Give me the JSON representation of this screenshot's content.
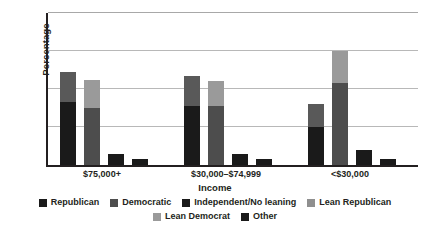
{
  "chart_data": {
    "type": "bar",
    "subtype": "grouped-stacked-bar",
    "title": "",
    "xlabel": "Income",
    "ylabel": "Percentage",
    "ylim": [
      0,
      80
    ],
    "yticks": [
      0,
      20,
      40,
      60,
      80
    ],
    "grid": true,
    "legend_position": "bottom",
    "categories": [
      "$75,000+",
      "$30,000–$74,999",
      "<$30,000"
    ],
    "series": [
      {
        "name": "Republican",
        "color": "#1a1a1a",
        "values": [
          33,
          31,
          20
        ]
      },
      {
        "name": "Lean Republican",
        "color": "#595959",
        "values": [
          16,
          16,
          12
        ]
      },
      {
        "name": "Democratic",
        "color": "#4d4d4d",
        "values": [
          30,
          31,
          43
        ]
      },
      {
        "name": "Lean Democrat",
        "color": "#9a9a9a",
        "values": [
          15,
          13,
          17
        ]
      },
      {
        "name": "Independent/No leaning",
        "color": "#1a1a1a",
        "values": [
          6,
          6,
          8
        ]
      },
      {
        "name": "Other",
        "color": "#1a1a1a",
        "values": [
          3,
          3,
          3
        ]
      }
    ],
    "bars": [
      {
        "group": "$75,000+",
        "items": [
          {
            "label": "Republican",
            "base": 33,
            "base_color": "#1a1a1a",
            "overlay": 16,
            "overlay_color": "#595959",
            "total": 49
          },
          {
            "label": "Democratic",
            "base": 30,
            "base_color": "#4d4d4d",
            "overlay": 15,
            "overlay_color": "#9a9a9a",
            "total": 45
          },
          {
            "label": "Independent/No leaning",
            "base": 6,
            "base_color": "#1a1a1a",
            "overlay": 0,
            "overlay_color": "#1a1a1a",
            "total": 6
          },
          {
            "label": "Other",
            "base": 3,
            "base_color": "#1a1a1a",
            "overlay": 0,
            "overlay_color": "#1a1a1a",
            "total": 3
          }
        ]
      },
      {
        "group": "$30,000–$74,999",
        "items": [
          {
            "label": "Republican",
            "base": 31,
            "base_color": "#1a1a1a",
            "overlay": 16,
            "overlay_color": "#595959",
            "total": 47
          },
          {
            "label": "Democratic",
            "base": 31,
            "base_color": "#4d4d4d",
            "overlay": 13,
            "overlay_color": "#9a9a9a",
            "total": 44
          },
          {
            "label": "Independent/No leaning",
            "base": 6,
            "base_color": "#1a1a1a",
            "overlay": 0,
            "overlay_color": "#1a1a1a",
            "total": 6
          },
          {
            "label": "Other",
            "base": 3,
            "base_color": "#1a1a1a",
            "overlay": 0,
            "overlay_color": "#1a1a1a",
            "total": 3
          }
        ]
      },
      {
        "group": "<$30,000",
        "items": [
          {
            "label": "Republican",
            "base": 20,
            "base_color": "#1a1a1a",
            "overlay": 12,
            "overlay_color": "#595959",
            "total": 32
          },
          {
            "label": "Democratic",
            "base": 43,
            "base_color": "#4d4d4d",
            "overlay": 17,
            "overlay_color": "#9a9a9a",
            "total": 60
          },
          {
            "label": "Independent/No leaning",
            "base": 8,
            "base_color": "#1a1a1a",
            "overlay": 0,
            "overlay_color": "#1a1a1a",
            "total": 8
          },
          {
            "label": "Other",
            "base": 3,
            "base_color": "#1a1a1a",
            "overlay": 0,
            "overlay_color": "#1a1a1a",
            "total": 3
          }
        ]
      }
    ],
    "legend": [
      {
        "label": "Republican",
        "color": "#1a1a1a"
      },
      {
        "label": "Democratic",
        "color": "#4d4d4d"
      },
      {
        "label": "Independent/No leaning",
        "color": "#1a1a1a"
      },
      {
        "label": "Lean Republican",
        "color": "#8f8f8f"
      },
      {
        "label": "Lean Democrat",
        "color": "#9a9a9a"
      },
      {
        "label": "Other",
        "color": "#1a1a1a"
      }
    ]
  }
}
